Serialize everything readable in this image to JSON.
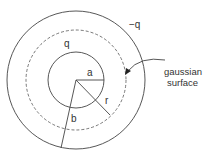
{
  "diagram": {
    "labels": {
      "inner_charge": "q",
      "outer_charge": "−q",
      "inner_radius": "a",
      "gaussian_radius": "r",
      "outer_radius": "b",
      "callout_line1": "gaussian",
      "callout_line2": "surface"
    },
    "elements": {
      "inner_sphere": "solid circle of radius a",
      "gaussian_surface": "dashed circle of radius r",
      "outer_sphere": "solid circle of radius b"
    },
    "colors": {
      "stroke": "#444444",
      "text": "#333333"
    }
  }
}
